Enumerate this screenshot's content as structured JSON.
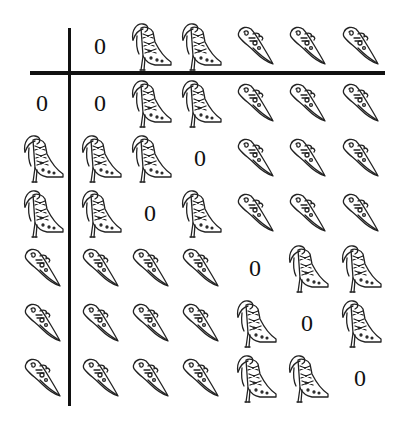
{
  "legend": {
    "B": "high-heeled-boot",
    "S": "flat-pointed-shoe",
    "0": "zero"
  },
  "zero_label": "0",
  "column_centers": [
    100,
    150,
    200,
    255,
    307,
    360
  ],
  "row_centers": [
    103,
    158,
    213,
    268,
    323,
    378
  ],
  "header_row_y": 46,
  "row_label_x": 42,
  "header": [
    "0",
    "B",
    "B",
    "S",
    "S",
    "S"
  ],
  "rows": [
    {
      "label": "0",
      "cells": [
        "0",
        "B",
        "B",
        "S",
        "S",
        "S"
      ]
    },
    {
      "label": "B",
      "cells": [
        "B",
        "B",
        "0",
        "S",
        "S",
        "S"
      ]
    },
    {
      "label": "B",
      "cells": [
        "B",
        "0",
        "B",
        "S",
        "S",
        "S"
      ]
    },
    {
      "label": "S",
      "cells": [
        "S",
        "S",
        "S",
        "0",
        "B",
        "B"
      ]
    },
    {
      "label": "S",
      "cells": [
        "S",
        "S",
        "S",
        "B",
        "0",
        "B"
      ]
    },
    {
      "label": "S",
      "cells": [
        "S",
        "S",
        "S",
        "B",
        "B",
        "0"
      ]
    }
  ]
}
